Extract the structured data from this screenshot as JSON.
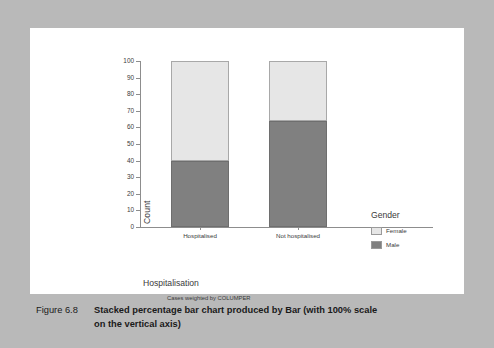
{
  "caption": {
    "number": "Figure 6.8",
    "text_line1": "Stacked percentage bar chart produced by Bar (with 100% scale",
    "text_line2": "on the vertical axis)"
  },
  "footnote": "Cases weighted by COLUMPER",
  "legend": {
    "title": "Gender",
    "items": [
      {
        "label": "Female",
        "color": "#e6e6e6"
      },
      {
        "label": "Male",
        "color": "#808080"
      }
    ]
  },
  "chart_data": {
    "type": "bar",
    "stacked": true,
    "title": "",
    "xlabel": "Hospitalisation",
    "ylabel": "Count",
    "categories": [
      "Hospitalised",
      "Not hospitalised"
    ],
    "ylim": [
      0,
      100
    ],
    "yticks": [
      0,
      10,
      20,
      30,
      40,
      50,
      60,
      70,
      80,
      90,
      100
    ],
    "ytick_labels": [
      "0",
      "10",
      "20",
      "30",
      "40",
      "50",
      "60",
      "70",
      "80",
      "90",
      "100"
    ],
    "grid": false,
    "legend_position": "right",
    "series": [
      {
        "name": "Male",
        "color": "#808080",
        "values": [
          40,
          64
        ]
      },
      {
        "name": "Female",
        "color": "#e6e6e6",
        "values": [
          60,
          36
        ]
      }
    ],
    "annotation": "Cases weighted by COLUMPER"
  }
}
